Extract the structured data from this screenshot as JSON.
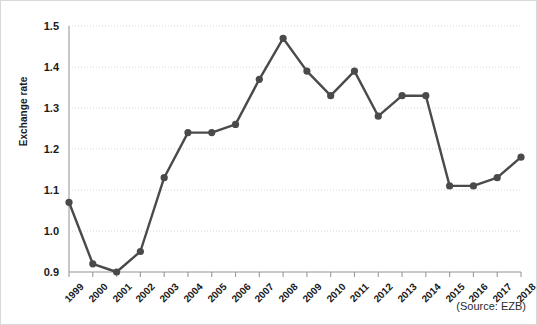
{
  "figure": {
    "source_note": "(Source: EZB)",
    "ylabel": "Exchange rate",
    "line_color": "#4a4a4a",
    "grid_color": "#d7d7d7",
    "axis_color": "#9a9a9a",
    "background": "#ffffff"
  },
  "chart_data": {
    "type": "line",
    "title": "",
    "subtitle": "",
    "xlabel": "",
    "ylabel": "Exchange rate",
    "categories": [
      "1999",
      "2000",
      "2001",
      "2002",
      "2003",
      "2004",
      "2005",
      "2006",
      "2007",
      "2008",
      "2009",
      "2010",
      "2011",
      "2012",
      "2013",
      "2014",
      "2015",
      "2016",
      "2017",
      "2018"
    ],
    "values": [
      1.07,
      0.92,
      0.9,
      0.95,
      1.13,
      1.24,
      1.24,
      1.26,
      1.37,
      1.47,
      1.39,
      1.33,
      1.39,
      1.28,
      1.33,
      1.33,
      1.11,
      1.11,
      1.13,
      1.18
    ],
    "series": [
      {
        "name": "Exchange rate",
        "values": [
          1.07,
          0.92,
          0.9,
          0.95,
          1.13,
          1.24,
          1.24,
          1.26,
          1.37,
          1.47,
          1.39,
          1.33,
          1.39,
          1.28,
          1.33,
          1.33,
          1.11,
          1.11,
          1.13,
          1.18
        ]
      }
    ],
    "ylim": [
      0.9,
      1.5
    ],
    "ytick_labels": [
      "0.9",
      "1.0",
      "1.1",
      "1.2",
      "1.3",
      "1.4",
      "1.5"
    ],
    "ytick_values": [
      0.9,
      1.0,
      1.1,
      1.2,
      1.3,
      1.4,
      1.5
    ],
    "xtick_labels": [
      "1999",
      "2000",
      "2001",
      "2002",
      "2003",
      "2004",
      "2005",
      "2006",
      "2007",
      "2008",
      "2009",
      "2010",
      "2011",
      "2012",
      "2013",
      "2014",
      "2015",
      "2016",
      "2017",
      "2018"
    ],
    "grid": true,
    "grid_axis": "y",
    "legend": false,
    "legend_position": "none",
    "marker": "circle",
    "annotations": [
      "(Source: EZB)"
    ]
  }
}
